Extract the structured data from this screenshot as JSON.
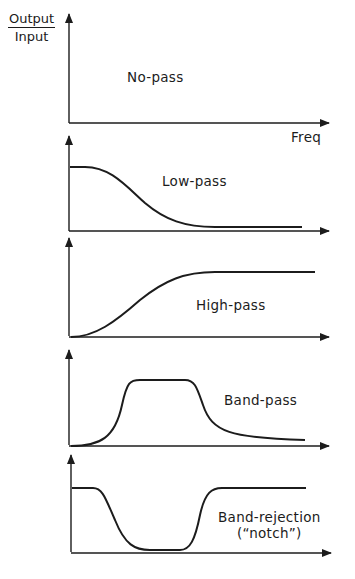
{
  "diagram": {
    "y_axis_label": {
      "numerator": "Output",
      "denominator": "Input"
    },
    "x_axis_label": "Freq",
    "colors": {
      "ink": "#1c1c1c",
      "background": "#ffffff"
    },
    "panels": [
      {
        "id": "no-pass",
        "label": "No-pass",
        "response": "zero at all frequencies"
      },
      {
        "id": "low-pass",
        "label": "Low-pass",
        "response": "high at low frequencies, rolls off to near zero"
      },
      {
        "id": "high-pass",
        "label": "High-pass",
        "response": "near zero at low frequencies, rises to plateau"
      },
      {
        "id": "band-pass",
        "label": "Band-pass",
        "response": "passes a middle band of frequencies"
      },
      {
        "id": "band-rejection",
        "label": "Band-rejection",
        "label_line2": "(“notch”)",
        "response": "passes all except a middle band"
      }
    ]
  }
}
